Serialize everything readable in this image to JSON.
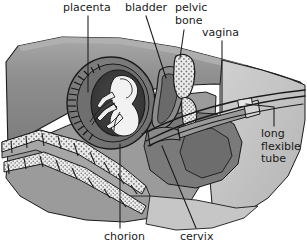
{
  "figure": {
    "type": "anatomical-diagram",
    "view": "lateral sagittal section",
    "background_color": "#ffffff",
    "line_color": "#1a1a1a",
    "palette": {
      "outline": "#1a1a1a",
      "body_dark": "#7c7c7c",
      "body_mid": "#949494",
      "body_light": "#bdbdbd",
      "rump_light": "#c8c8c8",
      "uterus_dark": "#5a5a5a",
      "amnion_dark": "#3a3a3a",
      "fetus_white": "#f2f2f2",
      "bone_white": "#f0f0f0",
      "stipple": "#6e6e6e",
      "highlight": "#d8d8d8"
    }
  },
  "labels": [
    {
      "id": "placenta",
      "text": "placenta",
      "name": "label-placenta"
    },
    {
      "id": "bladder",
      "text": "bladder",
      "name": "label-bladder"
    },
    {
      "id": "pelvic",
      "text": "pelvic\nbone",
      "name": "label-pelvic-bone"
    },
    {
      "id": "vagina",
      "text": "vagina",
      "name": "label-vagina"
    },
    {
      "id": "tube",
      "text": "long\nflexible\ntube",
      "name": "label-long-flexible-tube"
    },
    {
      "id": "chorion",
      "text": "chorion",
      "name": "label-chorion"
    },
    {
      "id": "cervix",
      "text": "cervix",
      "name": "label-cervix"
    }
  ],
  "structures": [
    {
      "name": "placenta",
      "description": "placental attachment on chorionic sac wall"
    },
    {
      "name": "bladder",
      "description": "urinary bladder, ventral to rectum"
    },
    {
      "name": "pelvic-bone",
      "description": "pelvic bone shown in stippled white section"
    },
    {
      "name": "vagina",
      "description": "vaginal canal leading to cervix"
    },
    {
      "name": "long-flexible-tube",
      "description": "embryo transfer catheter inserted through vagina and cervix"
    },
    {
      "name": "chorion",
      "description": "chorionic membrane surrounding the conceptus"
    },
    {
      "name": "cervix",
      "description": "cervix between uterus and vagina"
    },
    {
      "name": "fetus",
      "description": "curled fetus within amniotic cavity"
    },
    {
      "name": "spine",
      "description": "vertebral column with stippled vertebrae"
    }
  ]
}
